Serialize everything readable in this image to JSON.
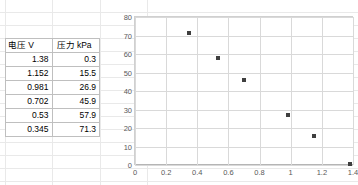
{
  "app": {
    "kind": "spreadsheet-with-chart"
  },
  "table": {
    "name": "voltage-pressure-table",
    "headers": [
      "电压 V",
      "压力 kPa"
    ],
    "rows": [
      [
        "1.38",
        "0.3"
      ],
      [
        "1.152",
        "15.5"
      ],
      [
        "0.981",
        "26.9"
      ],
      [
        "0.702",
        "45.9"
      ],
      [
        "0.53",
        "57.9"
      ],
      [
        "0.345",
        "71.3"
      ]
    ]
  },
  "chart_data": {
    "type": "scatter",
    "title": "",
    "xlabel": "",
    "ylabel": "",
    "xlim": [
      0,
      1.4
    ],
    "ylim": [
      0,
      80
    ],
    "xticks": [
      "0",
      "0.2",
      "0.4",
      "0.6",
      "0.8",
      "1",
      "1.2",
      "1.4"
    ],
    "xtick_values": [
      0,
      0.2,
      0.4,
      0.6,
      0.8,
      1,
      1.2,
      1.4
    ],
    "yticks": [
      "0",
      "10",
      "20",
      "30",
      "40",
      "50",
      "60",
      "70",
      "80"
    ],
    "ytick_values": [
      0,
      10,
      20,
      30,
      40,
      50,
      60,
      70,
      80
    ],
    "grid": true,
    "legend": false,
    "marker_color": "#3f3f3f",
    "series": [
      {
        "name": "压力 kPa",
        "x": [
          1.38,
          1.152,
          0.981,
          0.702,
          0.53,
          0.345
        ],
        "y": [
          0.3,
          15.5,
          26.9,
          45.9,
          57.9,
          71.3
        ]
      }
    ]
  },
  "colors": {
    "sheet_gridline": "#e9e9e9",
    "table_border": "#bfbfbf",
    "chart_gridline": "#d9d9d9",
    "tick_label": "#595959"
  }
}
